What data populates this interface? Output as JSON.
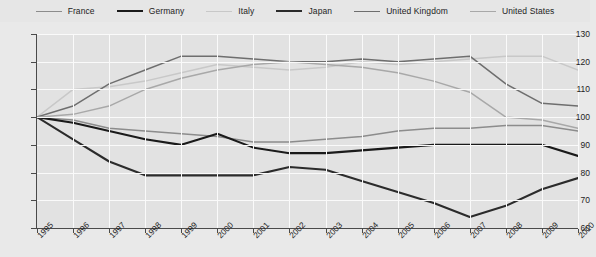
{
  "legend": {
    "position": "top",
    "items": [
      {
        "label": "France",
        "color": "#8c8c8c",
        "width": 1.6
      },
      {
        "label": "Germany",
        "color": "#1a1a1a",
        "width": 2.2
      },
      {
        "label": "Italy",
        "color": "#c8c8c8",
        "width": 1.6
      },
      {
        "label": "Japan",
        "color": "#2b2b2b",
        "width": 2.2
      },
      {
        "label": "United Kingdom",
        "color": "#6e6e6e",
        "width": 1.6
      },
      {
        "label": "United States",
        "color": "#a8a8a8",
        "width": 1.6
      }
    ]
  },
  "axes": {
    "y_ticks": [
      "130",
      "120",
      "110",
      "100",
      "90",
      "80",
      "70",
      "60"
    ],
    "x_ticks": [
      "1995",
      "1996",
      "1997",
      "1998",
      "1999",
      "2000",
      "2001",
      "2002",
      "2003",
      "2004",
      "2005",
      "2006",
      "2007",
      "2008",
      "2009",
      "2010"
    ]
  },
  "source_note": "",
  "chart_data": {
    "type": "line",
    "title": "",
    "xlabel": "",
    "ylabel": "",
    "xlim": [
      1995,
      2010
    ],
    "ylim": [
      60,
      130
    ],
    "grid": true,
    "legend_position": "top",
    "x": [
      1995,
      1996,
      1997,
      1998,
      1999,
      2000,
      2001,
      2002,
      2003,
      2004,
      2005,
      2006,
      2007,
      2008,
      2009,
      2010
    ],
    "series": [
      {
        "name": "France",
        "color": "#8c8c8c",
        "values": [
          100,
          99,
          96,
          95,
          94,
          93,
          91,
          91,
          92,
          93,
          95,
          96,
          96,
          97,
          97,
          95
        ]
      },
      {
        "name": "Germany",
        "color": "#1a1a1a",
        "values": [
          100,
          98,
          95,
          92,
          90,
          94,
          89,
          87,
          87,
          88,
          89,
          90,
          90,
          90,
          90,
          86
        ]
      },
      {
        "name": "Italy",
        "color": "#c8c8c8",
        "values": [
          100,
          110,
          111,
          113,
          116,
          119,
          118,
          117,
          118,
          120,
          119,
          120,
          121,
          122,
          122,
          117
        ]
      },
      {
        "name": "Japan",
        "color": "#2b2b2b",
        "values": [
          100,
          92,
          84,
          79,
          79,
          79,
          79,
          82,
          81,
          77,
          73,
          69,
          64,
          68,
          74,
          78
        ]
      },
      {
        "name": "United Kingdom",
        "color": "#6e6e6e",
        "values": [
          100,
          104,
          112,
          117,
          122,
          122,
          121,
          120,
          120,
          121,
          120,
          121,
          122,
          112,
          105,
          104
        ]
      },
      {
        "name": "United States",
        "color": "#a8a8a8",
        "values": [
          100,
          101,
          104,
          110,
          114,
          117,
          119,
          120,
          119,
          118,
          116,
          113,
          109,
          100,
          99,
          96
        ]
      }
    ]
  }
}
